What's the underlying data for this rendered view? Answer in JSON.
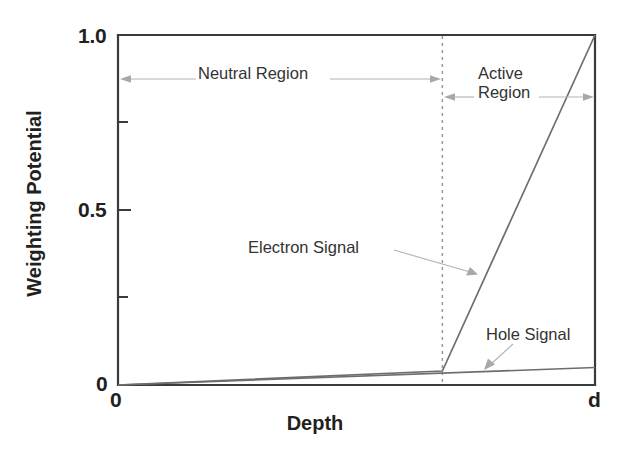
{
  "chart_data": {
    "type": "line",
    "title": "",
    "xlabel": "Depth",
    "ylabel": "Weighting Potential",
    "xlim": [
      0,
      1
    ],
    "ylim": [
      0,
      1
    ],
    "x_tick_labels": [
      "0",
      "d"
    ],
    "y_tick_labels": [
      "0",
      "0.5",
      "1.0"
    ],
    "y_ticks_major": [
      0,
      0.5,
      1.0
    ],
    "y_ticks_minor": [
      0.25,
      0.75
    ],
    "grid": false,
    "legend": "none",
    "series": [
      {
        "name": "Electron Signal",
        "x": [
          0,
          0.68,
          1.0
        ],
        "values": [
          0.0,
          0.04,
          1.0
        ]
      },
      {
        "name": "Hole Signal",
        "x": [
          0,
          1.0
        ],
        "values": [
          0.0,
          0.05
        ]
      }
    ],
    "annotations": [
      {
        "name": "Neutral Region",
        "text": "Neutral Region",
        "kind": "span-arrow",
        "x_from": 0.0,
        "x_to": 0.68,
        "y": 0.855
      },
      {
        "name": "Active Region",
        "text_line1": "Active",
        "text_line2": "Region",
        "kind": "span-arrow",
        "x_from": 0.68,
        "x_to": 1.0,
        "y": 0.805
      },
      {
        "name": "Electron Signal",
        "text": "Electron Signal",
        "kind": "leader-arrow",
        "target_x": 0.75,
        "target_y": 0.325
      },
      {
        "name": "Hole Signal",
        "text": "Hole Signal",
        "kind": "leader-arrow",
        "target_x": 0.79,
        "target_y": 0.055
      }
    ],
    "colors": {
      "axis": "#3a3a3a",
      "series": "#6d6d6d",
      "divider": "#9a9a9a",
      "annotation": "#a8a8a8",
      "text": "#231f20",
      "background": "#ffffff"
    },
    "divider": {
      "name": "active-region-boundary",
      "x": 0.68,
      "style": "dashed"
    }
  },
  "axes": {
    "y_labels": {
      "top": "1.0",
      "mid": "0.5",
      "bottom": "0"
    },
    "x_labels": {
      "left": "0",
      "right": "d"
    },
    "x_title": "Depth",
    "y_title": "Weighting Potential"
  },
  "labels": {
    "neutral_region": "Neutral Region",
    "active_region_line1": "Active",
    "active_region_line2": "Region",
    "electron_signal": "Electron Signal",
    "hole_signal": "Hole Signal"
  }
}
